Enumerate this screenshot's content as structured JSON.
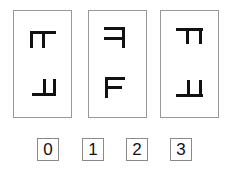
{
  "puzzle": {
    "type": "mental-rotation",
    "cards": [
      {
        "index": 0,
        "top_glyph": "F-rotated-mirrored",
        "bottom_glyph": "F-rotated-mirrored"
      },
      {
        "index": 1,
        "top_glyph": "F-mirrored",
        "bottom_glyph": "F"
      },
      {
        "index": 2,
        "top_glyph": "F-rotated-mirrored",
        "bottom_glyph": "F-rotated-mirrored"
      }
    ],
    "answers": [
      {
        "label": "0"
      },
      {
        "label": "1"
      },
      {
        "label": "2"
      },
      {
        "label": "3"
      }
    ]
  },
  "colors": {
    "glyph": "#111111",
    "card_border": "#9a9a9a",
    "box_border": "#8a8a8a",
    "background": "#ffffff"
  }
}
